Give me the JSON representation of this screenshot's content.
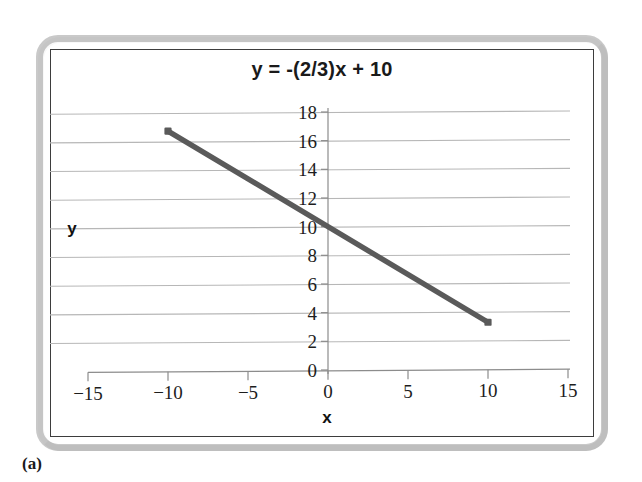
{
  "figure": {
    "panel_caption": "(a)",
    "title": "y = -(2/3)x + 10"
  },
  "axes": {
    "x_label": "x",
    "y_label": "y"
  },
  "colors": {
    "line": "#5a5a5a",
    "gridline": "#b7b7b7",
    "axis": "#8c8c8c",
    "border": "#3d3d3d",
    "frame": "#c9c9c9",
    "text": "#1a1a1a"
  },
  "chart_data": {
    "type": "line",
    "title": "y = -(2/3)x + 10",
    "xlabel": "x",
    "ylabel": "y",
    "xlim": [
      -15,
      15
    ],
    "ylim": [
      0,
      18
    ],
    "xticks": [
      -15,
      -10,
      -5,
      0,
      5,
      10,
      15
    ],
    "xtick_labels": [
      "−15",
      "−10",
      "−5",
      "0",
      "5",
      "10",
      "15"
    ],
    "yticks": [
      0,
      2,
      4,
      6,
      8,
      10,
      12,
      14,
      16,
      18
    ],
    "ytick_labels": [
      "0",
      "2",
      "4",
      "6",
      "8",
      "10",
      "12",
      "14",
      "16",
      "18"
    ],
    "grid": "horizontal",
    "legend": null,
    "series": [
      {
        "name": "y = -(2/3)x + 10",
        "equation": "y = -(2/3)x + 10",
        "slope": -0.6667,
        "intercept": 10,
        "color": "#5a5a5a",
        "x": [
          -10,
          10
        ],
        "y": [
          16.67,
          3.33
        ],
        "points": [
          {
            "x": -10,
            "y": 16.67
          },
          {
            "x": -5,
            "y": 13.33
          },
          {
            "x": 0,
            "y": 10
          },
          {
            "x": 5,
            "y": 6.67
          },
          {
            "x": 10,
            "y": 3.33
          }
        ]
      }
    ]
  }
}
